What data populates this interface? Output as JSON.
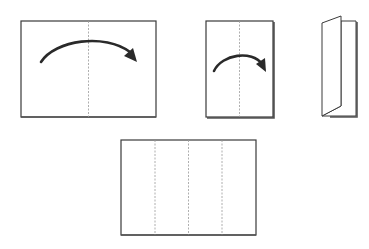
{
  "diagram": {
    "title": "",
    "colors": {
      "outline": "#3a3a3a",
      "fold_line": "#9a9a9a",
      "arrow": "#2a2a2a",
      "background": "#ffffff"
    },
    "steps": [
      {
        "id": "step-1",
        "label": "",
        "shape": "landscape-sheet",
        "fold_lines": 1,
        "arrow": "fold-right"
      },
      {
        "id": "step-2",
        "label": "",
        "shape": "portrait-half-sheet",
        "fold_lines": 1,
        "arrow": "fold-right"
      },
      {
        "id": "step-3",
        "label": "",
        "shape": "folded-booklet",
        "fold_lines": 0,
        "arrow": "none"
      },
      {
        "id": "step-4",
        "label": "",
        "shape": "unfolded-sheet-four-panels",
        "fold_lines": 3,
        "arrow": "none"
      }
    ]
  }
}
